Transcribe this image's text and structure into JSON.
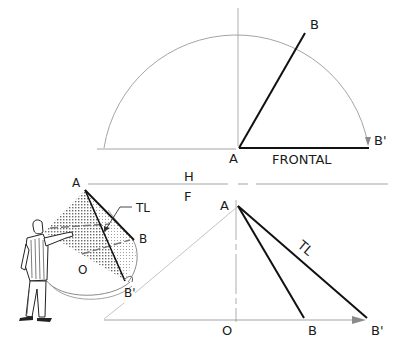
{
  "diagram": {
    "top_view": {
      "labels": {
        "a": "A",
        "b": "B",
        "b_prime": "B'",
        "frontal": "FRONTAL"
      }
    },
    "folding_line": {
      "h": "H",
      "f": "F"
    },
    "front_view": {
      "labels": {
        "a": "A",
        "o": "O",
        "b": "B",
        "b_prime": "B'",
        "tl": "TL"
      }
    },
    "pictorial": {
      "labels": {
        "a": "A",
        "b": "B",
        "b_prime": "B'",
        "o": "O",
        "tl": "TL"
      }
    },
    "colors": {
      "line": "#111111",
      "construction": "#9a9a9a",
      "hatch": "#8a8a8a"
    }
  }
}
